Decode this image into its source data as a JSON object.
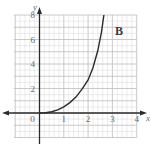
{
  "chart_data": {
    "type": "line",
    "title": "",
    "panel_label": "B",
    "xlabel": "x",
    "ylabel": "y",
    "xlim": [
      -1,
      4
    ],
    "ylim": [
      -2,
      8
    ],
    "grid": true,
    "x_ticks": [
      {
        "value": 0,
        "label": "0"
      },
      {
        "value": 1,
        "label": "1"
      },
      {
        "value": 2,
        "label": "2"
      },
      {
        "value": 3,
        "label": "3"
      },
      {
        "value": 4,
        "label": "4"
      }
    ],
    "y_ticks": [
      {
        "value": 2,
        "label": "2"
      },
      {
        "value": 4,
        "label": "4"
      },
      {
        "value": 6,
        "label": "6"
      },
      {
        "value": 8,
        "label": "8"
      }
    ],
    "series": [
      {
        "name": "curve",
        "x": [
          0,
          0.25,
          0.5,
          0.75,
          1.0,
          1.25,
          1.5,
          1.75,
          2.0,
          2.2,
          2.4,
          2.55,
          2.65
        ],
        "y": [
          0,
          0.02,
          0.1,
          0.25,
          0.5,
          0.85,
          1.3,
          1.95,
          2.7,
          3.7,
          5.1,
          6.6,
          8.0
        ]
      }
    ],
    "legend": null
  },
  "colors": {
    "grid_minor": "#d9d9d9",
    "grid_major": "#bdbdbd",
    "axis": "#2b2b2b",
    "curve": "#2b2b2b",
    "text": "#6a6a6a"
  }
}
